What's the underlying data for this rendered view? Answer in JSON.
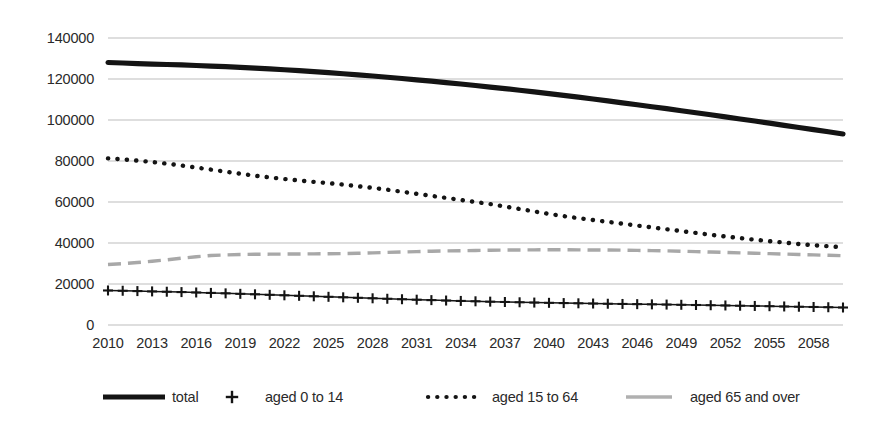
{
  "chart_data": {
    "type": "line",
    "title": "",
    "subtitle": "",
    "xlabel": "",
    "ylabel": "",
    "xlim": [
      2010,
      2060
    ],
    "ylim": [
      0,
      140000
    ],
    "grid": true,
    "legend_position": "bottom",
    "y_ticks": [
      "0",
      "20000",
      "40000",
      "60000",
      "80000",
      "100000",
      "120000",
      "140000"
    ],
    "y_tick_values": [
      0,
      20000,
      40000,
      60000,
      80000,
      100000,
      120000,
      140000
    ],
    "x_ticks": [
      "2010",
      "2013",
      "2016",
      "2019",
      "2022",
      "2025",
      "2028",
      "2031",
      "2034",
      "2037",
      "2040",
      "2043",
      "2046",
      "2049",
      "2052",
      "2055",
      "2058"
    ],
    "x_tick_values": [
      2010,
      2013,
      2016,
      2019,
      2022,
      2025,
      2028,
      2031,
      2034,
      2037,
      2040,
      2043,
      2046,
      2049,
      2052,
      2055,
      2058
    ],
    "x": [
      2010,
      2011,
      2012,
      2013,
      2014,
      2015,
      2016,
      2017,
      2018,
      2019,
      2020,
      2021,
      2022,
      2023,
      2024,
      2025,
      2026,
      2027,
      2028,
      2029,
      2030,
      2031,
      2032,
      2033,
      2034,
      2035,
      2036,
      2037,
      2038,
      2039,
      2040,
      2041,
      2042,
      2043,
      2044,
      2045,
      2046,
      2047,
      2048,
      2049,
      2050,
      2051,
      2052,
      2053,
      2054,
      2055,
      2056,
      2057,
      2058,
      2059,
      2060
    ],
    "series": [
      {
        "name": "total",
        "style": "solid",
        "color": "#141414",
        "values": [
          128057,
          127799,
          127515,
          127298,
          127083,
          126847,
          126597,
          126329,
          126027,
          125691,
          125325,
          124932,
          124512,
          124066,
          123595,
          123099,
          122577,
          122031,
          121461,
          120867,
          120249,
          119607,
          118942,
          118255,
          117547,
          116818,
          116068,
          115297,
          114504,
          113690,
          112855,
          111999,
          111123,
          110228,
          109315,
          108386,
          107442,
          106484,
          105514,
          104532,
          103540,
          102539,
          101530,
          100512,
          99486,
          98452,
          97410,
          96361,
          95306,
          94246,
          93180
        ]
      },
      {
        "name": "aged 0 to 14",
        "style": "plus-markers",
        "color": "#141414",
        "values": [
          16839,
          16705,
          16547,
          16390,
          16233,
          16057,
          15866,
          15658,
          15437,
          15205,
          14967,
          14727,
          14484,
          14241,
          13997,
          13752,
          13508,
          13267,
          13029,
          12796,
          12568,
          12348,
          12136,
          11934,
          11742,
          11561,
          11391,
          11232,
          11084,
          10945,
          10816,
          10695,
          10581,
          10473,
          10369,
          10268,
          10168,
          10068,
          9966,
          9861,
          9754,
          9643,
          9528,
          9410,
          9289,
          9166,
          9041,
          8915,
          8789,
          8663,
          8538
        ]
      },
      {
        "name": "aged 15 to 64",
        "style": "dotted",
        "color": "#141414",
        "values": [
          81285,
          80800,
          80200,
          79500,
          78700,
          77800,
          76800,
          75800,
          74800,
          73800,
          72800,
          72000,
          71200,
          70500,
          69800,
          69200,
          68500,
          67700,
          66900,
          66000,
          65000,
          64000,
          63000,
          62000,
          61000,
          60000,
          59000,
          57800,
          56600,
          55400,
          54200,
          53100,
          52100,
          51200,
          50300,
          49400,
          48500,
          47600,
          46700,
          45800,
          44900,
          44000,
          43200,
          42400,
          41600,
          40900,
          40200,
          39500,
          38900,
          38400,
          37900
        ]
      },
      {
        "name": "aged 65 and over",
        "style": "dashed",
        "color": "#a8a8a8",
        "values": [
          29484,
          29900,
          30500,
          31100,
          31800,
          32600,
          33300,
          33900,
          34200,
          34400,
          34500,
          34550,
          34600,
          34650,
          34700,
          34750,
          34850,
          35000,
          35200,
          35400,
          35600,
          35800,
          36000,
          36150,
          36250,
          36350,
          36450,
          36550,
          36600,
          36650,
          36700,
          36700,
          36650,
          36600,
          36550,
          36500,
          36400,
          36300,
          36150,
          36000,
          35800,
          35600,
          35400,
          35200,
          35000,
          34800,
          34600,
          34400,
          34200,
          34000,
          33800
        ]
      }
    ]
  },
  "legend": {
    "items": [
      {
        "label": "total",
        "style": "solid",
        "color": "#141414"
      },
      {
        "label": "aged 0 to 14",
        "style": "plus-markers",
        "color": "#141414"
      },
      {
        "label": "aged 15 to 64",
        "style": "dotted",
        "color": "#141414"
      },
      {
        "label": "aged 65 and over",
        "style": "dashed",
        "color": "#a8a8a8"
      }
    ]
  },
  "colors": {
    "background": "#ffffff",
    "gridline": "#b6b6b6",
    "text": "#2a2a2a",
    "series_dark": "#141414",
    "series_gray": "#a8a8a8"
  }
}
